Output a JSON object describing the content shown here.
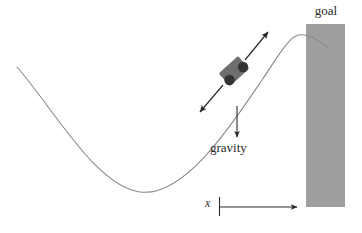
{
  "figure": {
    "name": "mountain-car-diagram",
    "width": 362,
    "height": 233,
    "background_color": "#ffffff"
  },
  "labels": {
    "goal": "goal",
    "gravity": "gravity",
    "x_axis": "x"
  },
  "colors": {
    "background": "#ffffff",
    "curve": "#8a8a8a",
    "goal_rect_fill": "#9e9e9e",
    "car_body": "#6e6e6e",
    "car_wheel": "#333333",
    "arrow": "#2b2b2b",
    "text": "#2b2b2b"
  },
  "elements": {
    "hill_curve": {
      "name": "hill-curve",
      "description": "sinusoidal valley track",
      "stroke_width": 1,
      "start_point": [
        17,
        67
      ],
      "valley_bottom": [
        140,
        192
      ],
      "peak": [
        296,
        35
      ],
      "end_point": [
        327,
        47
      ]
    },
    "goal_rect": {
      "name": "goal-rectangle",
      "x": 306,
      "y": 24,
      "width": 39,
      "height": 183
    },
    "car": {
      "name": "car-body",
      "center": [
        234,
        71
      ],
      "width": 26,
      "height": 17,
      "rotation_deg": -42,
      "wheels": [
        {
          "name": "front-wheel",
          "cx": 243,
          "cy": 67,
          "r": 5
        },
        {
          "name": "rear-wheel",
          "cx": 230,
          "cy": 80,
          "r": 5
        }
      ]
    },
    "action_arrow_up": {
      "name": "action-arrow-upslope",
      "from": [
        245,
        60
      ],
      "to": [
        269,
        31
      ]
    },
    "action_arrow_down": {
      "name": "action-arrow-downslope",
      "from": [
        223,
        85
      ],
      "to": [
        199,
        113
      ]
    },
    "gravity_arrow": {
      "name": "gravity-arrow",
      "from": [
        237,
        106
      ],
      "to": [
        237,
        138
      ]
    },
    "x_axis_arrow": {
      "name": "x-axis-arrow",
      "tick_x": 219,
      "tick_top": 197,
      "tick_bottom": 216,
      "from": [
        219,
        207
      ],
      "to": [
        299,
        207
      ]
    }
  }
}
